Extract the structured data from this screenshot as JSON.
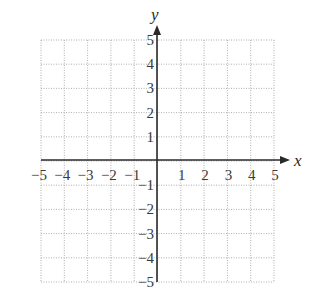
{
  "chart_data": {
    "type": "scatter",
    "title": "",
    "xlabel": "x",
    "ylabel": "y",
    "xlim": [
      -5,
      5
    ],
    "ylim": [
      -5,
      5
    ],
    "grid": true,
    "grid_style": "dotted",
    "x_ticks": [
      -5,
      -4,
      -3,
      -2,
      -1,
      1,
      2,
      3,
      4,
      5
    ],
    "y_ticks": [
      5,
      4,
      3,
      2,
      1,
      -1,
      -2,
      -3,
      -4,
      -5
    ],
    "x_tick_labels": [
      "−5",
      "−4",
      "−3",
      "−2",
      "−1",
      "1",
      "2",
      "3",
      "4",
      "5"
    ],
    "y_tick_labels": [
      "5",
      "4",
      "3",
      "2",
      "1",
      "−1",
      "−2",
      "−3",
      "−4",
      "−5"
    ],
    "series": [],
    "legend": null
  },
  "colors": {
    "axis": "#2a2a2a",
    "grid": "#9a9a9a",
    "text": "#3a3a3a"
  }
}
